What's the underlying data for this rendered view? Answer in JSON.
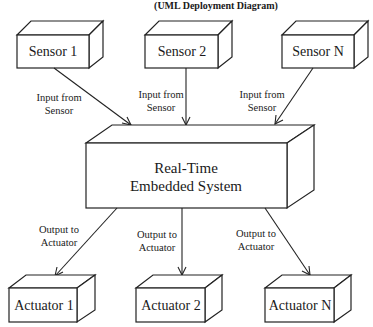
{
  "title": "(UML Deployment Diagram)",
  "colors": {
    "stroke": "#222222",
    "background": "#ffffff",
    "text": "#1a1a1a"
  },
  "sensors": [
    {
      "label": "Sensor 1",
      "edge_label_1": "Input from",
      "edge_label_2": "Sensor"
    },
    {
      "label": "Sensor 2",
      "edge_label_1": "Input from",
      "edge_label_2": "Sensor"
    },
    {
      "label": "Sensor N",
      "edge_label_1": "Input from",
      "edge_label_2": "Sensor"
    }
  ],
  "system": {
    "label_line1": "Real-Time",
    "label_line2": "Embedded System"
  },
  "actuators": [
    {
      "label": "Actuator 1",
      "edge_label_1": "Output to",
      "edge_label_2": "Actuator"
    },
    {
      "label": "Actuator 2",
      "edge_label_1": "Output to",
      "edge_label_2": "Actuator"
    },
    {
      "label": "Actuator N",
      "edge_label_1": "Output to",
      "edge_label_2": "Actuator"
    }
  ]
}
